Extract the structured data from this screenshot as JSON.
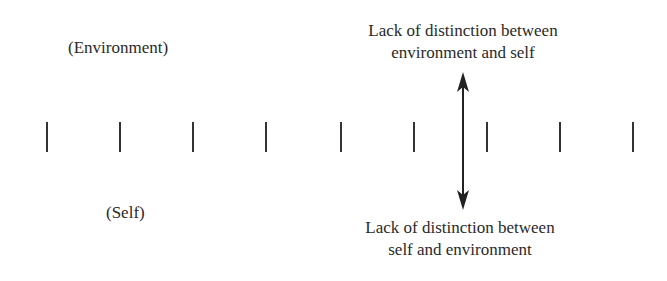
{
  "diagram": {
    "environment_label": "(Environment)",
    "self_label": "(Self)",
    "top_annotation": {
      "line1": "Lack of distinction between",
      "line2": "environment and self"
    },
    "bottom_annotation": {
      "line1": "Lack of distinction between",
      "line2": "self and environment"
    },
    "tick_count": 9,
    "tick_positions_px": [
      47,
      120,
      193,
      266,
      341,
      414,
      487,
      560,
      633
    ],
    "arrow": {
      "type": "double-headed",
      "x": 463,
      "y_top": 72,
      "y_bottom": 210
    },
    "colors": {
      "text": "#2a2a2a",
      "lines": "#333333",
      "background": "#ffffff"
    }
  }
}
